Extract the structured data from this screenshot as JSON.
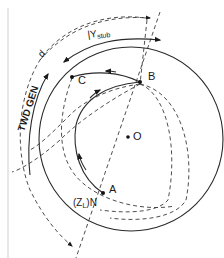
{
  "diagram": {
    "type": "smith-chart-stub-matching",
    "points": {
      "A": "A",
      "B": "B",
      "C": "C",
      "O": "O"
    },
    "labels": {
      "zl_n_open": "(Z",
      "zl_n_sub": "L",
      "zl_n_close": ")N",
      "y_stub_main": "|Y",
      "y_stub_sub": "stub",
      "twd_gen": "TWD GEN",
      "d": "d"
    },
    "colors": {
      "line": "#2a2a2a",
      "background": "#ffffff"
    }
  }
}
